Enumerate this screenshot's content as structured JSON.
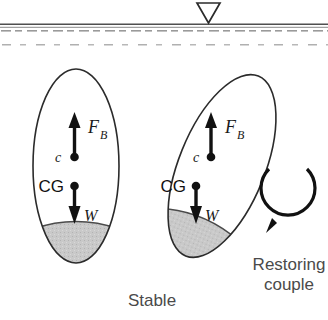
{
  "figure": {
    "name": "buoyancy-stability-diagram",
    "caption_stable": "Stable",
    "caption_restoring_line1": "Restoring",
    "caption_restoring_line2": "couple",
    "colors": {
      "outline": "#2b2b2b",
      "ballast_fill": "#c9c9c9",
      "water_line": "#555555",
      "water_hatch": "#9a9a9a",
      "arrow": "#111111",
      "caption_text": "#4a4a4a"
    },
    "water": {
      "marker_icon": "water-level-triangle-icon",
      "surface_label": ""
    },
    "vessels": [
      {
        "id": "upright-vessel",
        "state": "upright",
        "tilt_degrees": 0,
        "buoyancy_label": "F",
        "buoyancy_subscript": "B",
        "center_of_buoyancy_label": "c",
        "center_of_gravity_label": "CG",
        "weight_label": "W"
      },
      {
        "id": "tilted-vessel",
        "state": "tilted",
        "tilt_degrees": 22,
        "buoyancy_label": "F",
        "buoyancy_subscript": "B",
        "center_of_buoyancy_label": "c",
        "center_of_gravity_label": "CG",
        "weight_label": "W"
      }
    ],
    "restoring_couple": {
      "icon": "circular-arrow-icon",
      "direction": "counterclockwise"
    }
  }
}
